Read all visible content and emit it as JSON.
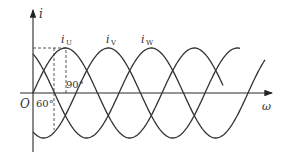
{
  "figure": {
    "type": "three-phase sinusoidal current waveform",
    "y_axis_label": "i",
    "x_axis_label": "ω",
    "origin_label": "O",
    "angle_labels": [
      "60°",
      "90°"
    ],
    "series_labels": [
      {
        "name": "i",
        "sub": "U"
      },
      {
        "name": "i",
        "sub": "V"
      },
      {
        "name": "i",
        "sub": "W"
      }
    ]
  },
  "chart_data": {
    "type": "line",
    "title": "",
    "xlabel": "ω",
    "ylabel": "i",
    "phase_shift_deg": 120,
    "series": [
      {
        "name": "iU",
        "phase_deg": 0,
        "peak_at_deg": 90
      },
      {
        "name": "iV",
        "phase_deg": -120,
        "peak_at_deg": 210
      },
      {
        "name": "iW",
        "phase_deg": -240,
        "peak_at_deg": 330
      }
    ],
    "annotations": [
      {
        "text": "60°",
        "x_deg": 60
      },
      {
        "text": "90°",
        "x_deg": 90
      }
    ],
    "grid": false
  },
  "colors": {
    "line": "#333333",
    "background": "#ffffff"
  }
}
